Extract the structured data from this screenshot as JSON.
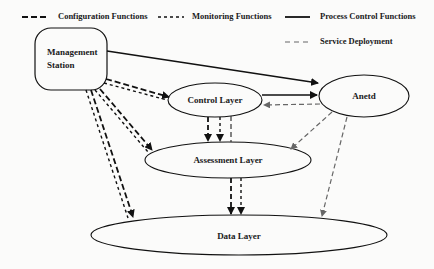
{
  "legend": {
    "configuration": "Configuration Functions",
    "monitoring": "Monitoring Functions",
    "process_control": "Process Control Functions",
    "service_deployment": "Service Deployment"
  },
  "nodes": {
    "management_station": "Management Station",
    "management_line1": "Management",
    "management_line2": "Station",
    "control_layer": "Control Layer",
    "anetd": "Anetd",
    "assessment_layer": "Assessment Layer",
    "data_layer": "Data Layer"
  },
  "edges": [
    {
      "from": "Management Station",
      "to": "Anetd",
      "type": "process_control"
    },
    {
      "from": "Control Layer",
      "to": "Anetd",
      "type": "process_control"
    },
    {
      "from": "Anetd",
      "to": "Control Layer",
      "type": "service_deployment"
    },
    {
      "from": "Anetd",
      "to": "Assessment Layer",
      "type": "service_deployment"
    },
    {
      "from": "Anetd",
      "to": "Data Layer",
      "type": "service_deployment"
    },
    {
      "from": "Management Station",
      "to": "Control Layer",
      "type": "configuration+monitoring"
    },
    {
      "from": "Management Station",
      "to": "Assessment Layer",
      "type": "configuration+monitoring"
    },
    {
      "from": "Management Station",
      "to": "Data Layer",
      "type": "configuration+monitoring"
    },
    {
      "from": "Control Layer",
      "to": "Assessment Layer",
      "type": "configuration+monitoring+service_deployment"
    },
    {
      "from": "Assessment Layer",
      "to": "Data Layer",
      "type": "configuration+monitoring"
    }
  ]
}
